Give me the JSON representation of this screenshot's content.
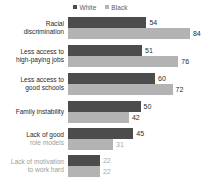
{
  "legend": {
    "position": "top-center",
    "items": [
      {
        "label": "White",
        "marker": "square-marker-icon",
        "color": "#4c4c4c"
      },
      {
        "label": "Black",
        "marker": "square-marker-icon",
        "color": "#b3b3b3"
      }
    ]
  },
  "chart_data": {
    "type": "bar",
    "orientation": "horizontal",
    "title": "",
    "subtitle": "",
    "xlabel": "",
    "ylabel": "",
    "xlim": [
      0,
      90
    ],
    "grid": false,
    "legend_position": "top-center",
    "categories": [
      "Racial discrimination",
      "Less access to high-paying jobs",
      "Less access to good schools",
      "Family instability",
      "Lack of good role models",
      "Lack of motivation to work hard"
    ],
    "series": [
      {
        "name": "White",
        "color": "#4c4c4c",
        "values": [
          54,
          51,
          60,
          50,
          45,
          22
        ]
      },
      {
        "name": "Black",
        "color": "#b3b3b3",
        "values": [
          84,
          76,
          72,
          42,
          31,
          22
        ]
      }
    ]
  },
  "groups": [
    {
      "label_lines": [
        "Racial",
        "discrimination"
      ],
      "label_faded": [
        false,
        false
      ],
      "dimmed": false,
      "bars": [
        {
          "series": "White",
          "value": 54,
          "value_text": "54",
          "faded": false
        },
        {
          "series": "Black",
          "value": 84,
          "value_text": "84",
          "faded": false
        }
      ]
    },
    {
      "label_lines": [
        "Less access to",
        "high-paying jobs"
      ],
      "label_faded": [
        false,
        false
      ],
      "dimmed": false,
      "bars": [
        {
          "series": "White",
          "value": 51,
          "value_text": "51",
          "faded": false
        },
        {
          "series": "Black",
          "value": 76,
          "value_text": "76",
          "faded": false
        }
      ]
    },
    {
      "label_lines": [
        "Less access to",
        "good schools"
      ],
      "label_faded": [
        false,
        false
      ],
      "dimmed": false,
      "bars": [
        {
          "series": "White",
          "value": 60,
          "value_text": "60",
          "faded": false
        },
        {
          "series": "Black",
          "value": 72,
          "value_text": "72",
          "faded": false
        }
      ]
    },
    {
      "label_lines": [
        "Family instability"
      ],
      "label_faded": [
        false
      ],
      "dimmed": false,
      "bars": [
        {
          "series": "White",
          "value": 50,
          "value_text": "50",
          "faded": false
        },
        {
          "series": "Black",
          "value": 42,
          "value_text": "42",
          "faded": false
        }
      ]
    },
    {
      "label_lines": [
        "Lack of good",
        "role models"
      ],
      "label_faded": [
        false,
        true
      ],
      "dimmed": false,
      "bars": [
        {
          "series": "White",
          "value": 45,
          "value_text": "45",
          "faded": false
        },
        {
          "series": "Black",
          "value": 31,
          "value_text": "31",
          "faded": true
        }
      ]
    },
    {
      "label_lines": [
        "Lack of motivation",
        "to work hard"
      ],
      "label_faded": [
        true,
        true
      ],
      "dimmed": true,
      "bars": [
        {
          "series": "White",
          "value": 22,
          "value_text": "22",
          "faded": true
        },
        {
          "series": "Black",
          "value": 22,
          "value_text": "22",
          "faded": true
        }
      ]
    }
  ],
  "layout": {
    "bar_origin_x": 68,
    "px_per_unit": 1.452,
    "group_tops": [
      3,
      31,
      59,
      87,
      114,
      141
    ],
    "bar_height": 11,
    "plot_top": 14
  }
}
